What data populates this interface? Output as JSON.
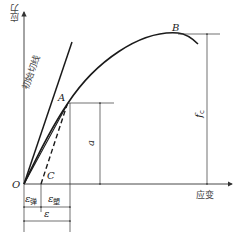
{
  "diagram": {
    "type": "stress-strain curve",
    "axes": {
      "y_label": "应力",
      "x_label": "应变",
      "origin_label": "O"
    },
    "points": {
      "A": "A",
      "B": "B",
      "C": "C"
    },
    "lines": {
      "initial_tangent_label": "初始切线"
    },
    "dimensions": {
      "a_label": "a",
      "fc_label": "f",
      "fc_sub": "c",
      "eps_elastic": "ε",
      "eps_elastic_sub": "弹",
      "eps_plastic": "ε",
      "eps_plastic_sub": "塑",
      "eps_total": "ε"
    },
    "colors": {
      "line": "#1a1a1a",
      "thin": "#333333"
    }
  }
}
